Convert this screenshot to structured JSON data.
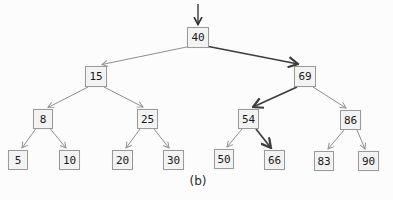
{
  "figure": {
    "caption": "(b)"
  },
  "tree": {
    "nodes": [
      {
        "label": "40"
      },
      {
        "label": "15"
      },
      {
        "label": "69"
      },
      {
        "label": "8"
      },
      {
        "label": "25"
      },
      {
        "label": "54"
      },
      {
        "label": "86"
      },
      {
        "label": "5"
      },
      {
        "label": "10"
      },
      {
        "label": "20"
      },
      {
        "label": "30"
      },
      {
        "label": "50"
      },
      {
        "label": "66"
      },
      {
        "label": "83"
      },
      {
        "label": "90"
      }
    ],
    "edges": [
      {
        "from": "40",
        "to": "15",
        "emphasis": false
      },
      {
        "from": "40",
        "to": "69",
        "emphasis": true
      },
      {
        "from": "15",
        "to": "8",
        "emphasis": false
      },
      {
        "from": "15",
        "to": "25",
        "emphasis": false
      },
      {
        "from": "69",
        "to": "54",
        "emphasis": true
      },
      {
        "from": "69",
        "to": "86",
        "emphasis": false
      },
      {
        "from": "8",
        "to": "5",
        "emphasis": false
      },
      {
        "from": "8",
        "to": "10",
        "emphasis": false
      },
      {
        "from": "25",
        "to": "20",
        "emphasis": false
      },
      {
        "from": "25",
        "to": "30",
        "emphasis": false
      },
      {
        "from": "54",
        "to": "50",
        "emphasis": false
      },
      {
        "from": "54",
        "to": "66",
        "emphasis": true
      },
      {
        "from": "86",
        "to": "83",
        "emphasis": false
      },
      {
        "from": "86",
        "to": "90",
        "emphasis": false
      }
    ],
    "highlighted_path": [
      "40",
      "69",
      "54",
      "66"
    ],
    "entry_arrow_target": "40"
  },
  "colors": {
    "background": "#fcfcfc",
    "node_fill": "#f3f3f3",
    "node_border": "#9a9a9a",
    "edge": "#8f8f8f",
    "edge_emphasis": "#3d3d3d",
    "text": "#1a1a1a"
  }
}
